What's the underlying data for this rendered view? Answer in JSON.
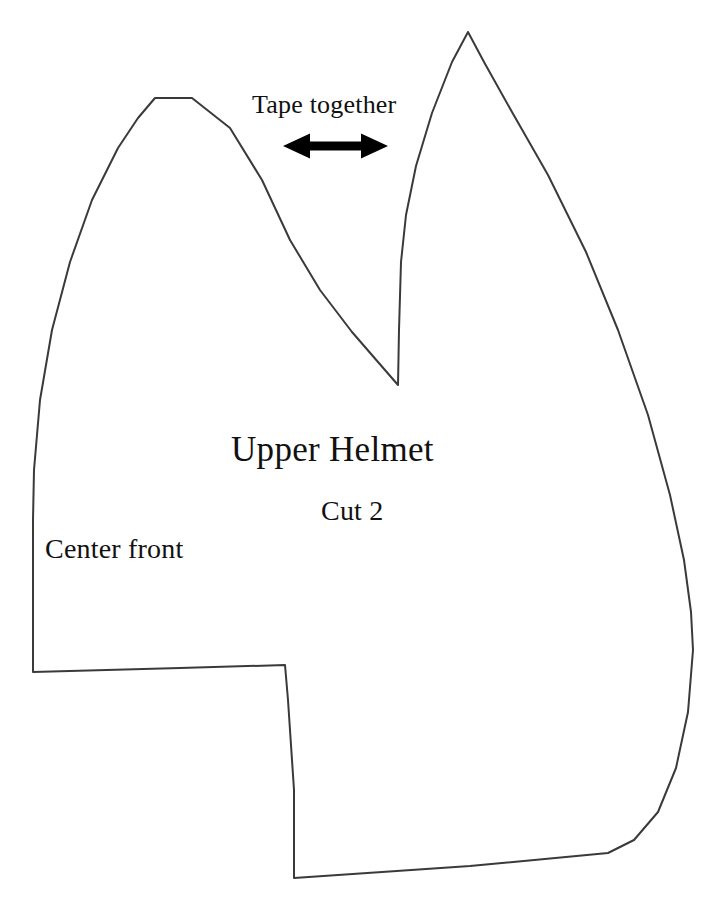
{
  "sheet": {
    "kind": "sewing-pattern-piece",
    "background_color": "#ffffff",
    "outline_color": "#3a3a3a",
    "outline_width_px": 2,
    "arrow_color": "#000000",
    "text_color": "#111111",
    "width_px": 723,
    "height_px": 907
  },
  "labels": {
    "tape_together": "Tape together",
    "piece_name": "Upper Helmet",
    "cut_quantity": "Cut 2",
    "center_front": "Center front"
  },
  "icons": {
    "double_arrow": "double-headed-horizontal-arrow"
  },
  "geometry": {
    "outline_path": "M 155 98 L 192 98 L 230 128 L 262 180 L 290 240 L 320 290 L 352 332 L 378 362 L 398 385 L 399 330 L 401 262 L 406 215 L 416 166 L 432 113 L 452 62 L 468 32 L 484 62 L 512 112 L 548 175 L 586 252 L 618 330 L 648 415 L 670 495 L 684 560 L 691 612 L 693 650 L 688 712 L 676 768 L 658 812 L 634 840 L 608 853 L 470 866 L 294 878 L 294 790 L 288 700 L 285 665 L 180 668 L 33 672 L 33 600 L 33 520 L 34 470 L 40 400 L 52 330 L 70 262 L 92 200 L 118 148 L 138 118 L 155 98 Z",
    "notch_tip": [
      398,
      385
    ],
    "left_peak": [
      174,
      98
    ],
    "right_peak": [
      468,
      32
    ],
    "rightmost_point": [
      693,
      650
    ],
    "step_corner": [
      285,
      665
    ],
    "arrow": {
      "x_start": 283,
      "x_end": 388,
      "y_center": 146,
      "shaft_height": 9,
      "head_height": 25,
      "head_width": 27
    }
  }
}
